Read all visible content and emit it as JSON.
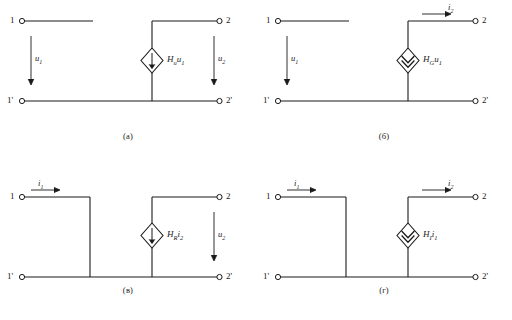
{
  "figure": {
    "title": "",
    "line_color": "#1a1a1a",
    "background": "#ffffff"
  },
  "panels": [
    {
      "id": "panel-a",
      "caption": "(а)",
      "terminals": {
        "in_top": "1",
        "in_bottom": "1'",
        "out_top": "2",
        "out_bottom": "2'"
      },
      "source": {
        "kind": "voltage-source-diamond",
        "label_h": "H",
        "label_sub": "u",
        "label_var": "u",
        "label_var_sub": "1",
        "label_text": "Hᵤu₁"
      },
      "quantities": [
        {
          "name": "input-voltage",
          "symbol": "u",
          "sub": "1",
          "arrow": "down"
        },
        {
          "name": "output-voltage",
          "symbol": "u",
          "sub": "2",
          "arrow": "down"
        }
      ]
    },
    {
      "id": "panel-b",
      "caption": "(б)",
      "terminals": {
        "in_top": "1",
        "in_bottom": "1'",
        "out_top": "2",
        "out_bottom": "2'"
      },
      "source": {
        "kind": "current-source-diamond",
        "label_h": "H",
        "label_sub": "G",
        "label_var": "u",
        "label_var_sub": "1",
        "label_text": "Hɢu₁"
      },
      "quantities": [
        {
          "name": "input-voltage",
          "symbol": "u",
          "sub": "1",
          "arrow": "down"
        },
        {
          "name": "output-current",
          "symbol": "i",
          "sub": "2",
          "arrow": "right"
        }
      ]
    },
    {
      "id": "panel-v",
      "caption": "(в)",
      "terminals": {
        "in_top": "1",
        "in_bottom": "1'",
        "out_top": "2",
        "out_bottom": "2'"
      },
      "source": {
        "kind": "voltage-source-diamond",
        "label_h": "H",
        "label_sub": "R",
        "label_var": "i",
        "label_var_sub": "2",
        "label_text": "Hʀi₂"
      },
      "quantities": [
        {
          "name": "input-current",
          "symbol": "i",
          "sub": "1",
          "arrow": "right"
        },
        {
          "name": "output-voltage",
          "symbol": "u",
          "sub": "2",
          "arrow": "down"
        }
      ]
    },
    {
      "id": "panel-g",
      "caption": "(г)",
      "terminals": {
        "in_top": "1",
        "in_bottom": "1'",
        "out_top": "2",
        "out_bottom": "2'"
      },
      "source": {
        "kind": "current-source-diamond",
        "label_h": "H",
        "label_sub": "I",
        "label_var": "i",
        "label_var_sub": "1",
        "label_text": "Hᴵi₁"
      },
      "quantities": [
        {
          "name": "input-current",
          "symbol": "i",
          "sub": "1",
          "arrow": "right"
        },
        {
          "name": "output-current",
          "symbol": "i",
          "sub": "2",
          "arrow": "right"
        }
      ]
    }
  ]
}
